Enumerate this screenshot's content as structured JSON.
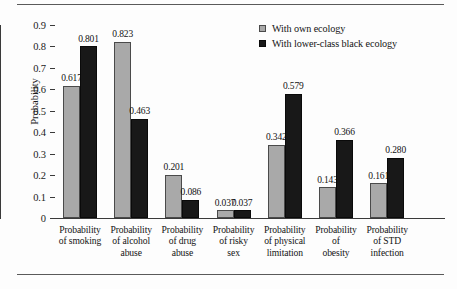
{
  "chart_data": {
    "type": "bar",
    "title": "",
    "xlabel": "",
    "ylabel": "Probability",
    "ylim": [
      0,
      0.9
    ],
    "yticks": [
      "0",
      "0.1",
      "0.2",
      "0.3",
      "0.4",
      "0.5",
      "0.6",
      "0.7",
      "0.8",
      "0.9"
    ],
    "grid": false,
    "legend_position": "top-right",
    "categories": [
      "Probability of smoking",
      "Probability of alcohol abuse",
      "Probability of drug abuse",
      "Probability of risky sex",
      "Probability of physical limitation",
      "Probability of obesity",
      "Probability of STD infection"
    ],
    "category_lines": [
      [
        "Probability",
        "of smoking"
      ],
      [
        "Probability",
        "of alcohol",
        "abuse"
      ],
      [
        "Probability",
        "of drug",
        "abuse"
      ],
      [
        "Probability",
        "of risky",
        "sex"
      ],
      [
        "Probability",
        "of physical",
        "limitation"
      ],
      [
        "Probability",
        "of",
        "obesity"
      ],
      [
        "Probability",
        "of STD",
        "infection"
      ]
    ],
    "series": [
      {
        "name": "With own ecology",
        "color": "#a9a9a9",
        "values": [
          0.617,
          0.823,
          0.201,
          0.037,
          0.342,
          0.143,
          0.161
        ],
        "labels": [
          "0.617",
          "0.823",
          "0.201",
          "0.037",
          "0.342",
          "0.143",
          "0.161"
        ]
      },
      {
        "name": "With lower-class black ecology",
        "color": "#181818",
        "values": [
          0.801,
          0.463,
          0.086,
          0.037,
          0.579,
          0.366,
          0.28
        ],
        "labels": [
          "0.801",
          "0.463",
          "0.086",
          "0.037",
          "0.579",
          "0.366",
          "0.280"
        ]
      }
    ]
  },
  "legend": {
    "items": [
      {
        "label": "With own ecology",
        "swatch": "own"
      },
      {
        "label": "With lower-class black ecology",
        "swatch": "lower"
      }
    ]
  }
}
